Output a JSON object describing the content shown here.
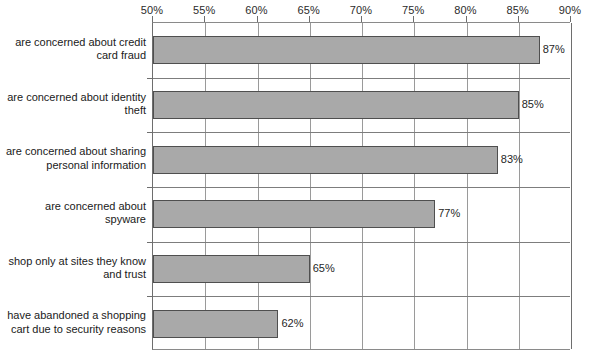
{
  "chart_data": {
    "type": "bar",
    "orientation": "horizontal",
    "title": "",
    "xlabel": "",
    "ylabel": "",
    "xlim": [
      50,
      90
    ],
    "xticks": [
      50,
      55,
      60,
      65,
      70,
      75,
      80,
      85,
      90
    ],
    "xtick_labels": [
      "50%",
      "55%",
      "60%",
      "65%",
      "70%",
      "75%",
      "80%",
      "85%",
      "90%"
    ],
    "xaxis_position": "top",
    "grid": "vertical",
    "legend": "none",
    "bar_color": "#a9a9a9",
    "bar_edge_color": "#4f4f4f",
    "categories": [
      "are concerned about credit\ncard fraud",
      "are concerned about identity\ntheft",
      "are concerned about sharing\npersonal information",
      "are concerned about\nspyware",
      "shop only at sites they know\nand trust",
      "have abandoned a shopping\ncart due to security reasons"
    ],
    "values": [
      87,
      85,
      83,
      77,
      65,
      62
    ],
    "value_labels": [
      "87%",
      "85%",
      "83%",
      "77%",
      "65%",
      "62%"
    ]
  }
}
